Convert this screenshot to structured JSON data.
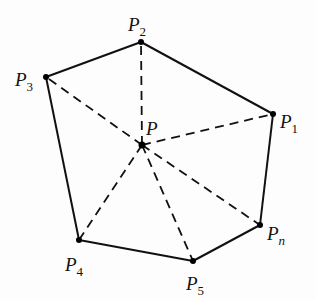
{
  "diagram": {
    "center": {
      "name": "P",
      "base": "P",
      "sub": ""
    },
    "vertices": [
      {
        "id": "P2",
        "base": "P",
        "sub": "2"
      },
      {
        "id": "P1",
        "base": "P",
        "sub": "1"
      },
      {
        "id": "Pn",
        "base": "P",
        "sub": "n"
      },
      {
        "id": "P5",
        "base": "P",
        "sub": "5"
      },
      {
        "id": "P4",
        "base": "P",
        "sub": "4"
      },
      {
        "id": "P3",
        "base": "P",
        "sub": "3"
      }
    ],
    "polygon_order": [
      "P2",
      "P1",
      "Pn",
      "P5",
      "P4",
      "P3"
    ],
    "edge_style": "solid",
    "spoke_style": "dashed"
  }
}
